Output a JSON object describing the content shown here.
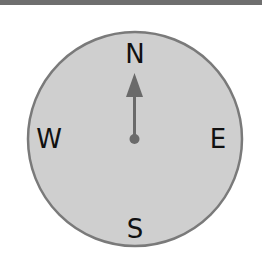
{
  "compass": {
    "directions": {
      "north": "N",
      "south": "S",
      "east": "E",
      "west": "W"
    },
    "needle_direction": "north",
    "colors": {
      "face": "#cfcfcf",
      "rim": "#7a7a7a",
      "needle": "#6a6a6a",
      "text": "#111111",
      "top_bar": "#6f6f6f"
    }
  }
}
